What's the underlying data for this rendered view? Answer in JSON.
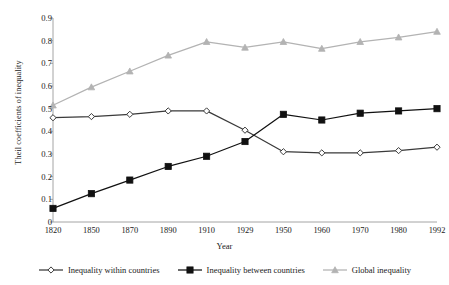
{
  "chart_data": {
    "type": "line",
    "title": "",
    "xlabel": "Year",
    "ylabel": "Theil coefficients of inequality",
    "categories": [
      "1820",
      "1850",
      "1870",
      "1890",
      "1910",
      "1929",
      "1950",
      "1960",
      "1970",
      "1980",
      "1992"
    ],
    "x_tick_labels": [
      "1820",
      "1850",
      "1870",
      "1890",
      "1910",
      "1929",
      "1950",
      "1960",
      "1970",
      "1980",
      "1992"
    ],
    "y_tick_labels": [
      "0",
      "0.1",
      "0.2",
      "0.3",
      "0.4",
      "0.5",
      "0.6",
      "0.7",
      "0.8",
      "0.9"
    ],
    "y_ticks": [
      0,
      0.1,
      0.2,
      0.3,
      0.4,
      0.5,
      0.6,
      0.7,
      0.8,
      0.9
    ],
    "ylim": [
      0,
      0.9
    ],
    "grid": false,
    "legend_position": "bottom",
    "series": [
      {
        "name": "Inequality within countries",
        "color": "#3a3a3a",
        "marker": "diamond-open",
        "values": [
          0.46,
          0.465,
          0.475,
          0.49,
          0.49,
          0.405,
          0.31,
          0.305,
          0.305,
          0.315,
          0.33
        ]
      },
      {
        "name": "Inequality between countries",
        "color": "#111111",
        "marker": "square-filled",
        "values": [
          0.06,
          0.125,
          0.185,
          0.245,
          0.29,
          0.355,
          0.475,
          0.45,
          0.48,
          0.49,
          0.5
        ]
      },
      {
        "name": "Global inequality",
        "color": "#b3b3b3",
        "marker": "triangle-filled",
        "values": [
          0.515,
          0.595,
          0.665,
          0.735,
          0.795,
          0.77,
          0.795,
          0.765,
          0.795,
          0.815,
          0.84
        ]
      }
    ]
  },
  "legend": {
    "items": [
      {
        "label": "Inequality within countries"
      },
      {
        "label": "Inequality between countries"
      },
      {
        "label": "Global inequality"
      }
    ]
  },
  "axes": {
    "x_title": "Year",
    "y_title": "Theil coefficients of inequality"
  }
}
